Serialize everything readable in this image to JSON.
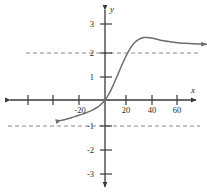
{
  "chart_data": {
    "type": "line",
    "title": "",
    "xlabel": "x",
    "ylabel": "y",
    "xlim": [
      -35,
      80
    ],
    "ylim": [
      -3.4,
      3.4
    ],
    "xticks": [
      -60,
      -40,
      -20,
      20,
      40,
      60
    ],
    "xtick_labels": [
      "",
      "",
      "-20",
      "20",
      "40",
      "60"
    ],
    "yticks": [
      3,
      2,
      1,
      -1,
      -2,
      -3
    ],
    "ytick_labels": [
      "3",
      "2",
      "1",
      "-1",
      "-2",
      "-3"
    ],
    "grid": false,
    "legend": null,
    "asymptotes": [
      {
        "name": "upper-asymptote",
        "type": "horizontal",
        "y": 2,
        "style": "dashed"
      },
      {
        "name": "lower-asymptote",
        "type": "horizontal",
        "y": -1,
        "style": "dashed"
      }
    ],
    "series": [
      {
        "name": "curve",
        "color": "#6e6e6e",
        "style": "solid",
        "left_arrow": true,
        "right_arrow": true,
        "x": [
          -34,
          -30,
          -26,
          -22,
          -18,
          -14,
          -10,
          -6,
          -3,
          0,
          3,
          6,
          9,
          12,
          15,
          18,
          21,
          24,
          27,
          30,
          33,
          36,
          40,
          45,
          50,
          56,
          62,
          68,
          74,
          78
        ],
        "y": [
          -0.85,
          -0.8,
          -0.74,
          -0.67,
          -0.6,
          -0.52,
          -0.43,
          -0.31,
          -0.18,
          0,
          0.25,
          0.58,
          0.95,
          1.33,
          1.7,
          2.02,
          2.28,
          2.45,
          2.55,
          2.6,
          2.6,
          2.58,
          2.53,
          2.47,
          2.43,
          2.39,
          2.36,
          2.34,
          2.33,
          2.32
        ]
      }
    ]
  },
  "axes": {
    "x_axis_name": "x-axis",
    "y_axis_name": "y-axis",
    "x_label": "x",
    "y_label": "y"
  },
  "colors": {
    "curve": "#6e6e6e",
    "axis": "#3a3a3a",
    "asymptote": "#8a8a8a",
    "text": "#2b2b2b",
    "background": "#ffffff"
  }
}
